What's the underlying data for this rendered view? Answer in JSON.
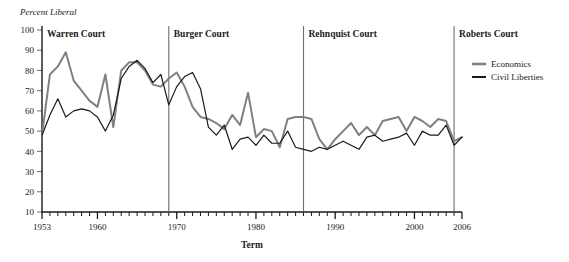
{
  "chart_data": {
    "type": "line",
    "title": "",
    "ylabel": "Percent Liberal",
    "xlabel": "Term",
    "ylim": [
      10,
      100
    ],
    "xlim": [
      1953,
      2006
    ],
    "yticks": [
      10,
      20,
      30,
      40,
      50,
      60,
      70,
      80,
      90,
      100
    ],
    "xticks_labeled": [
      1953,
      1960,
      1970,
      1980,
      1990,
      2000,
      2006
    ],
    "grid": false,
    "legend_position": "top-right",
    "x": [
      1953,
      1954,
      1955,
      1956,
      1957,
      1958,
      1959,
      1960,
      1961,
      1962,
      1963,
      1964,
      1965,
      1966,
      1967,
      1968,
      1969,
      1970,
      1971,
      1972,
      1973,
      1974,
      1975,
      1976,
      1977,
      1978,
      1979,
      1980,
      1981,
      1982,
      1983,
      1984,
      1985,
      1986,
      1987,
      1988,
      1989,
      1990,
      1991,
      1992,
      1993,
      1994,
      1995,
      1996,
      1997,
      1998,
      1999,
      2000,
      2001,
      2002,
      2003,
      2004,
      2005,
      2006
    ],
    "series": [
      {
        "name": "Economics",
        "color": "#808080",
        "values": [
          48,
          78,
          82,
          89,
          75,
          70,
          65,
          62,
          78,
          52,
          80,
          84,
          84,
          80,
          73,
          72,
          76,
          79,
          72,
          62,
          57,
          56,
          54,
          51,
          58,
          53,
          69,
          47,
          51,
          50,
          42,
          56,
          57,
          57,
          56,
          46,
          41,
          46,
          50,
          54,
          48,
          52,
          48,
          55,
          56,
          57,
          50,
          57,
          55,
          52,
          56,
          55,
          45,
          47
        ]
      },
      {
        "name": "Civil Liberties",
        "color": "#1a1a1a",
        "values": [
          48,
          58,
          66,
          57,
          60,
          61,
          60,
          57,
          50,
          58,
          76,
          82,
          85,
          81,
          74,
          78,
          63,
          72,
          77,
          79,
          71,
          52,
          48,
          53,
          41,
          46,
          47,
          43,
          48,
          44,
          44,
          50,
          42,
          41,
          40,
          42,
          41,
          43,
          45,
          43,
          41,
          47,
          48,
          45,
          46,
          47,
          49,
          43,
          50,
          48,
          48,
          53,
          43,
          47
        ]
      }
    ],
    "annotations": [
      {
        "name": "era-warren",
        "label": "Warren Court",
        "start": 1953,
        "end": 1969
      },
      {
        "name": "era-burger",
        "label": "Burger Court",
        "start": 1969,
        "end": 1986
      },
      {
        "name": "era-rehnquist",
        "label": "Rehnquist Court",
        "start": 1986,
        "end": 2005
      },
      {
        "name": "era-roberts",
        "label": "Roberts Court",
        "start": 2005,
        "end": 2006
      }
    ],
    "dividers": [
      1969,
      1986,
      2005
    ]
  },
  "legend": {
    "items": [
      {
        "label": "Economics",
        "color": "#808080"
      },
      {
        "label": "Civil Liberties",
        "color": "#1a1a1a"
      }
    ]
  },
  "colors": {
    "economics": "#808080",
    "civil_liberties": "#1a1a1a",
    "axis": "#1a1a1a",
    "divider": "#6e6e6e",
    "background": "#ffffff"
  }
}
